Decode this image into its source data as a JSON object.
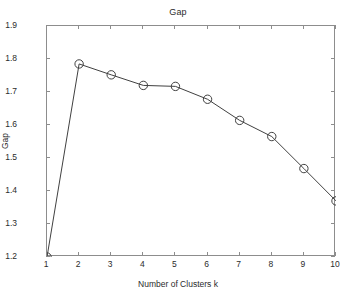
{
  "chart_data": {
    "type": "line",
    "title": "Gap",
    "xlabel": "Number of Clusters k",
    "ylabel": "Gap",
    "x": [
      1,
      2,
      3,
      4,
      5,
      6,
      7,
      8,
      9,
      10
    ],
    "values": [
      1.2,
      1.785,
      1.752,
      1.72,
      1.717,
      1.678,
      1.614,
      1.565,
      1.468,
      1.37
    ],
    "series": [
      {
        "name": "Gap",
        "values": [
          1.2,
          1.785,
          1.752,
          1.72,
          1.717,
          1.678,
          1.614,
          1.565,
          1.468,
          1.37
        ]
      }
    ],
    "xlim": [
      1,
      10
    ],
    "ylim": [
      1.2,
      1.9
    ],
    "xticks": [
      "1",
      "2",
      "3",
      "4",
      "5",
      "6",
      "7",
      "8",
      "9",
      "10"
    ],
    "yticks": [
      "1.2",
      "1.3",
      "1.4",
      "1.5",
      "1.6",
      "1.7",
      "1.8",
      "1.9"
    ],
    "grid": false,
    "legend": false,
    "marker": "open-circle",
    "line_color": "#404040",
    "marker_color": "#404040",
    "axis_color": "#8d8d8d",
    "background_color": "#ffffff"
  }
}
